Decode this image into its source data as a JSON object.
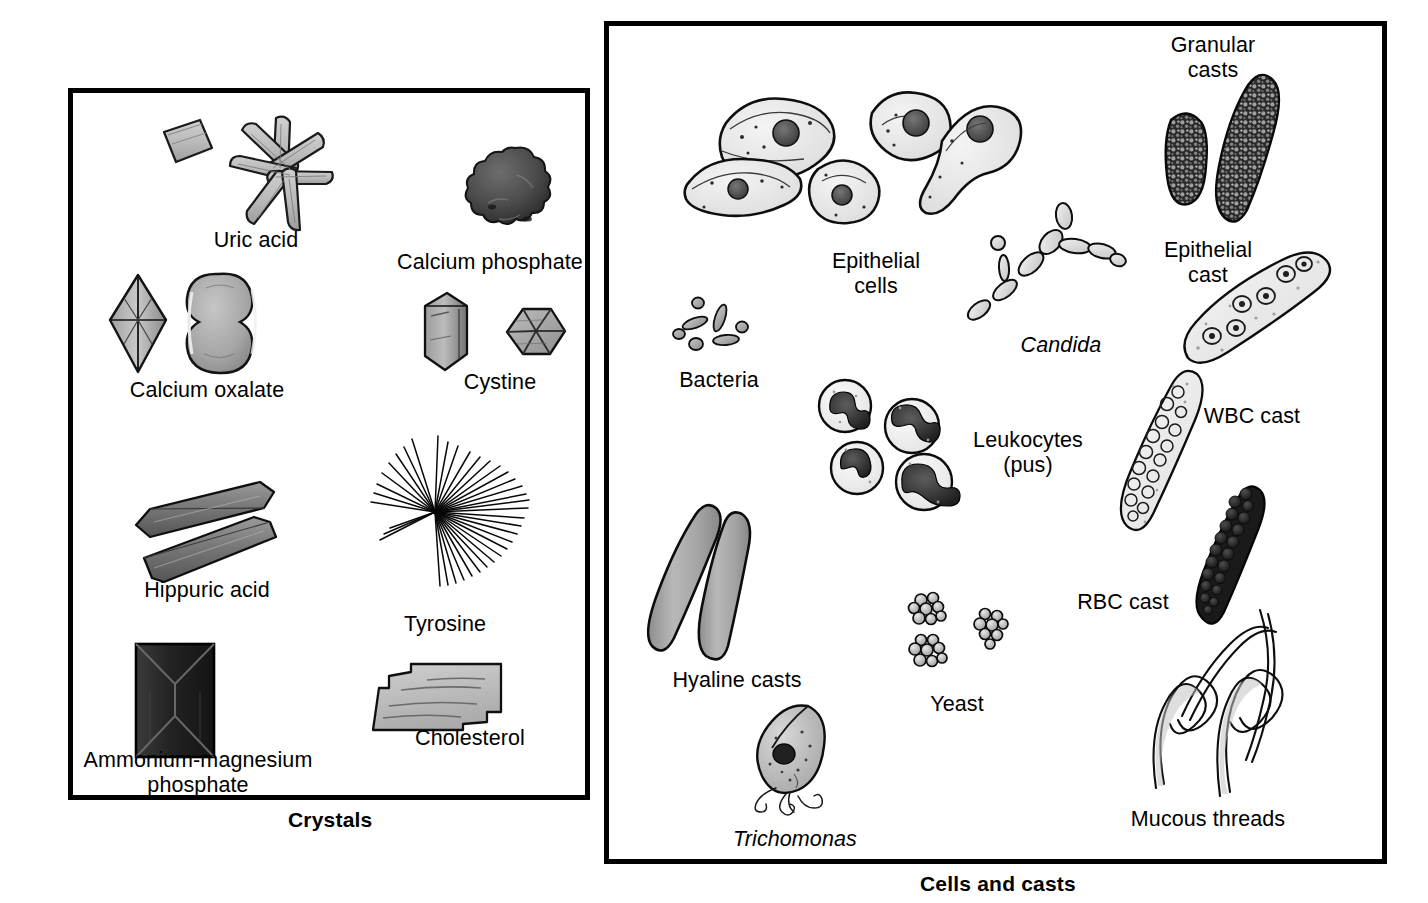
{
  "figure": {
    "background_color": "#ffffff",
    "line_color": "#000000"
  },
  "panels": [
    {
      "id": "crystals",
      "caption": "Crystals",
      "items": [
        {
          "name": "uric-acid",
          "label": "Uric acid"
        },
        {
          "name": "calcium-phosphate",
          "label": "Calcium phosphate"
        },
        {
          "name": "calcium-oxalate",
          "label": "Calcium oxalate"
        },
        {
          "name": "cystine",
          "label": "Cystine"
        },
        {
          "name": "hippuric-acid",
          "label": "Hippuric acid"
        },
        {
          "name": "tyrosine",
          "label": "Tyrosine"
        },
        {
          "name": "ammonium-magnesium-phosphate",
          "label": "Ammonium-magnesium\nphosphate"
        },
        {
          "name": "cholesterol",
          "label": "Cholesterol"
        }
      ]
    },
    {
      "id": "cells-and-casts",
      "caption": "Cells and casts",
      "items": [
        {
          "name": "epithelial-cells",
          "label": "Epithelial\ncells",
          "italic": false
        },
        {
          "name": "granular-casts",
          "label": "Granular\ncasts",
          "italic": false
        },
        {
          "name": "bacteria",
          "label": "Bacteria",
          "italic": false
        },
        {
          "name": "candida",
          "label": "Candida",
          "italic": true
        },
        {
          "name": "epithelial-cast",
          "label": "Epithelial\ncast",
          "italic": false
        },
        {
          "name": "leukocytes",
          "label": "Leukocytes\n(pus)",
          "italic": false
        },
        {
          "name": "wbc-cast",
          "label": "WBC cast",
          "italic": false
        },
        {
          "name": "hyaline-casts",
          "label": "Hyaline casts",
          "italic": false
        },
        {
          "name": "yeast",
          "label": "Yeast",
          "italic": false
        },
        {
          "name": "rbc-cast",
          "label": "RBC cast",
          "italic": false
        },
        {
          "name": "mucous-threads",
          "label": "Mucous threads",
          "italic": false
        },
        {
          "name": "trichomonas",
          "label": "Trichomonas",
          "italic": true
        }
      ]
    }
  ],
  "colors": {
    "outline": "#000000",
    "light_fill": "#d4d4d4",
    "mid_fill": "#a8a8a8",
    "dark_fill": "#4a4a4a",
    "very_dark_fill": "#2b2b2b",
    "pale_fill": "#ededed"
  }
}
